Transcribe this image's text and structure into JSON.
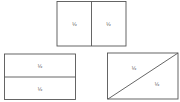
{
  "colors": {
    "stroke": "#555555",
    "background": "#ffffff",
    "text": "#333333"
  },
  "shapes": [
    {
      "id": "vertical-split",
      "description": "Rectangle split vertically into two halves",
      "labels": [
        "½",
        "½"
      ]
    },
    {
      "id": "horizontal-split",
      "description": "Rectangle split horizontally into two halves",
      "labels": [
        "½",
        "½"
      ]
    },
    {
      "id": "diagonal-split",
      "description": "Rectangle split diagonally into two triangular halves",
      "labels": [
        "½",
        "½"
      ]
    }
  ]
}
